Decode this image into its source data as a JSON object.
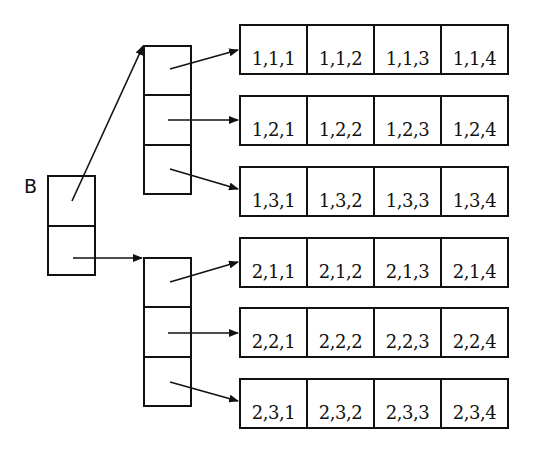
{
  "diagram": {
    "label": "B",
    "root": {
      "cells": 2
    },
    "mid_blocks": [
      {
        "index": 1,
        "cells": 3
      },
      {
        "index": 2,
        "cells": 3
      }
    ],
    "rows": [
      {
        "id": "1,1",
        "cells": [
          "1,1,1",
          "1,1,2",
          "1,1,3",
          "1,1,4"
        ]
      },
      {
        "id": "1,2",
        "cells": [
          "1,2,1",
          "1,2,2",
          "1,2,3",
          "1,2,4"
        ]
      },
      {
        "id": "1,3",
        "cells": [
          "1,3,1",
          "1,3,2",
          "1,3,3",
          "1,3,4"
        ]
      },
      {
        "id": "2,1",
        "cells": [
          "2,1,1",
          "2,1,2",
          "2,1,3",
          "2,1,4"
        ]
      },
      {
        "id": "2,2",
        "cells": [
          "2,2,1",
          "2,2,2",
          "2,2,3",
          "2,2,4"
        ]
      },
      {
        "id": "2,3",
        "cells": [
          "2,3,1",
          "2,3,2",
          "2,3,3",
          "2,3,4"
        ]
      }
    ]
  }
}
